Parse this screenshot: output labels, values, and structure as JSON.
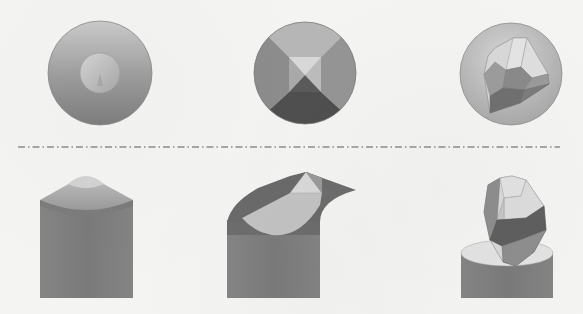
{
  "figure": {
    "background": "#f4f4f2",
    "separator": {
      "style": "dash-dot",
      "color": "#5a5a5a",
      "y": 147,
      "x_start": 18,
      "x_end": 560
    },
    "top_views": [
      {
        "id": "conical",
        "shape": "circle with inner circular cap and cone apex",
        "cx": 100,
        "cy": 73,
        "r": 52,
        "colors": {
          "outer_light": "#c8c8c8",
          "outer_dark": "#8a8a8a",
          "inner_cap": "#c4c4c4"
        }
      },
      {
        "id": "pyramidal",
        "shape": "circle divided into four quadrants with central square pyramid tip",
        "cx": 305,
        "cy": 73,
        "r": 51,
        "colors": {
          "top": "#b4b4b4",
          "left": "#8c8c8c",
          "right": "#929292",
          "bottom": "#4e4e4e",
          "tip_light": "#d6d6d6",
          "tip_mid": "#a8a8a8"
        }
      },
      {
        "id": "faceted",
        "shape": "circle with irregular faceted polyhedron",
        "cx": 511,
        "cy": 74,
        "r": 51,
        "colors": {
          "disk": "#bdbdbd",
          "facet_light": "#dedede",
          "facet_mid": "#a2a2a2",
          "facet_dark": "#6e6e6e"
        }
      }
    ],
    "side_views": [
      {
        "id": "conical",
        "shape": "cylinder with truncated cone top and light spherical cap",
        "x": 40,
        "width": 93,
        "top": 172,
        "bottom": 298,
        "colors": {
          "body": "#7c7c7c",
          "cone": "#a6a6a6",
          "cap": "#d2d2d2"
        }
      },
      {
        "id": "pyramidal",
        "shape": "cylinder with beveled sides and light curved front facet topped by pyramid",
        "x": 227,
        "width": 93,
        "top": 172,
        "bottom": 298,
        "colors": {
          "body": "#7c7c7c",
          "bevel": "#6a6a6a",
          "facet": "#c2c2c2",
          "pyramid": "#d8d8d8"
        }
      },
      {
        "id": "faceted",
        "shape": "flat-topped cylinder with faceted polyhedron tilted above it",
        "x": 461,
        "width": 92,
        "top": 240,
        "bottom": 298,
        "colors": {
          "body": "#7c7c7c",
          "top_face": "#e2e2e2",
          "facet_light": "#dadada",
          "facet_mid": "#9a9a9a",
          "facet_dark": "#5e5e5e"
        }
      }
    ]
  }
}
